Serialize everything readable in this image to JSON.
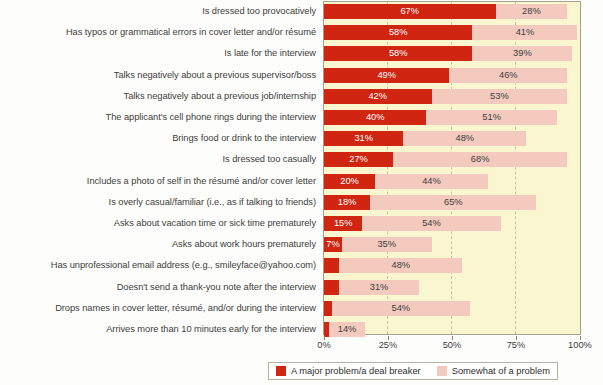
{
  "chart_data": {
    "type": "bar",
    "orientation": "horizontal",
    "stacked": true,
    "title": "",
    "xlabel": "",
    "ylabel": "",
    "xlim": [
      0,
      100
    ],
    "grid": true,
    "legend_position": "bottom",
    "xticks": [
      "0%",
      "25%",
      "50%",
      "75%",
      "100%"
    ],
    "xtick_values": [
      0,
      25,
      50,
      75,
      100
    ],
    "categories": [
      "Is dressed too provocatively",
      "Has typos or grammatical errors in cover letter and/or résumé",
      "Is late for the interview",
      "Talks negatively about a previous supervisor/boss",
      "Talks negatively about a previous job/internship",
      "The applicant's cell phone rings during the interview",
      "Brings food or drink to the interview",
      "Is dressed too casually",
      "Includes a photo of self in the résumé and/or cover letter",
      "Is overly casual/familiar (i.e., as if talking to friends)",
      "Asks about vacation time or sick time prematurely",
      "Asks about work hours prematurely",
      "Has unprofessional email address (e.g., smileyface@yahoo.com)",
      "Doesn't send a thank-you note after the interview",
      "Drops names in cover letter, résumé, and/or during the interview",
      "Arrives more than 10 minutes early for the interview"
    ],
    "series": [
      {
        "name": "A major problem/a deal breaker",
        "color": "#cf2511",
        "values": [
          67,
          58,
          58,
          49,
          42,
          40,
          31,
          27,
          20,
          18,
          15,
          7,
          6,
          6,
          3,
          2
        ],
        "labels": [
          "67%",
          "58%",
          "58%",
          "49%",
          "42%",
          "40%",
          "31%",
          "27%",
          "20%",
          "18%",
          "15%",
          "7%",
          "",
          "",
          "",
          ""
        ]
      },
      {
        "name": "Somewhat of a problem",
        "color": "#f3cabd",
        "values": [
          28,
          41,
          39,
          46,
          53,
          51,
          48,
          68,
          44,
          65,
          54,
          35,
          48,
          31,
          54,
          14
        ],
        "labels": [
          "28%",
          "41%",
          "39%",
          "46%",
          "53%",
          "51%",
          "48%",
          "68%",
          "44%",
          "65%",
          "54%",
          "35%",
          "48%",
          "31%",
          "54%",
          "14%"
        ]
      }
    ]
  },
  "legend": {
    "items": [
      {
        "label": "A major problem/a deal breaker",
        "color": "#cf2511"
      },
      {
        "label": "Somewhat of a problem",
        "color": "#f3cabd"
      }
    ]
  },
  "colors": {
    "major": "#cf2511",
    "somewhat": "#f3cabd",
    "plot_background": "#faf7d0",
    "plot_border": "#a3a08c",
    "gridline": "#c9c5a4",
    "text": "#3d3d3d"
  }
}
